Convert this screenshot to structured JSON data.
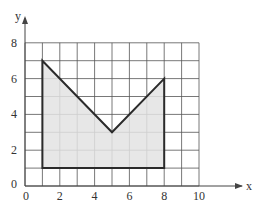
{
  "chart_data": {
    "type": "area",
    "title": "",
    "xlabel": "x",
    "ylabel": "y",
    "xlim": [
      0,
      10
    ],
    "ylim": [
      0,
      8
    ],
    "grid": true,
    "grid_step": 1,
    "x_ticks": [
      0,
      2,
      4,
      6,
      8,
      10
    ],
    "y_ticks": [
      0,
      2,
      4,
      6,
      8
    ],
    "series": [
      {
        "name": "shaded polygon",
        "closed": true,
        "points": [
          [
            1,
            1
          ],
          [
            1,
            7
          ],
          [
            5,
            3
          ],
          [
            8,
            6
          ],
          [
            8,
            1
          ]
        ]
      }
    ],
    "colors": {
      "fill": "#e3e3e3",
      "outline": "#2b2b2b",
      "grid": "#555555",
      "axis": "#444444"
    }
  }
}
